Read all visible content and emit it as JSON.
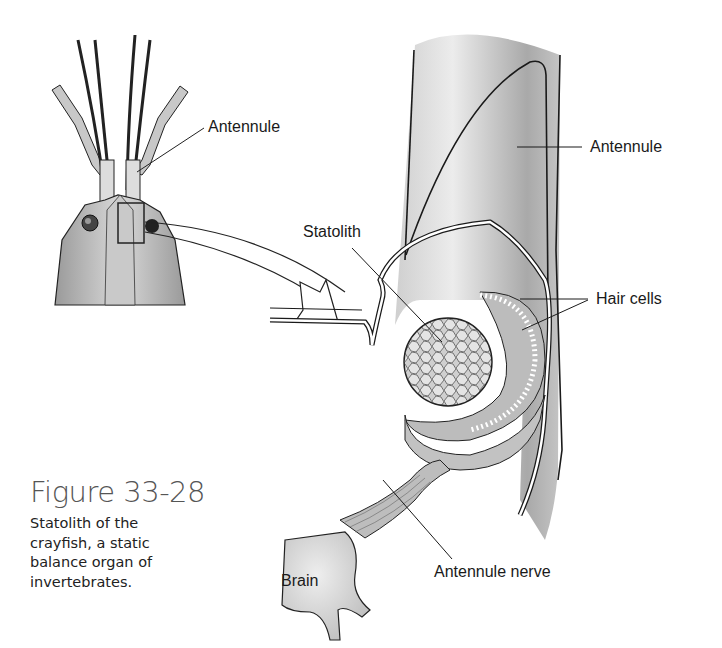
{
  "figure": {
    "title": "Figure 33-28",
    "caption": "Statolith of the crayfish, a static balance organ of invertebrates."
  },
  "labels": {
    "antennule_inset": "Antennule",
    "antennule_main": "Antennule",
    "statolith": "Statolith",
    "hair_cells": "Hair cells",
    "brain": "Brain",
    "antennule_nerve": "Antennule nerve"
  },
  "colors": {
    "ink": "#1a1a1a",
    "shade": "#b8b8b8",
    "caption_title": "#555555"
  }
}
